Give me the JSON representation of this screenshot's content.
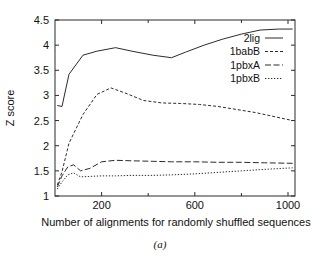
{
  "chart_data": {
    "type": "line",
    "title": "",
    "xlabel": "Number of alignments for randomly shuffled sequences",
    "ylabel": "Z score",
    "caption": "(a)",
    "xlim": [
      0,
      1030
    ],
    "ylim": [
      1,
      4.5
    ],
    "xticks": [
      200,
      600,
      1000
    ],
    "xticks_minor": [
      400,
      800
    ],
    "xtick_labels": [
      "200",
      "600",
      "1000"
    ],
    "yticks": [
      1,
      1.5,
      2,
      2.5,
      3,
      3.5,
      4,
      4.5
    ],
    "ytick_labels": [
      "1",
      "1.5",
      "2",
      "2.5",
      "3",
      "3.5",
      "4",
      "4.5"
    ],
    "grid": false,
    "legend_position": "upper-right",
    "series": [
      {
        "name": "2lig",
        "style": "solid",
        "x": [
          10,
          30,
          60,
          120,
          180,
          260,
          330,
          420,
          500,
          560,
          640,
          720,
          800,
          880,
          960,
          1020
        ],
        "y": [
          2.8,
          2.78,
          3.42,
          3.8,
          3.88,
          3.95,
          3.88,
          3.8,
          3.75,
          3.86,
          4.0,
          4.12,
          4.22,
          4.3,
          4.32,
          4.32
        ]
      },
      {
        "name": "1babB",
        "style": "dashed",
        "x": [
          10,
          30,
          60,
          120,
          180,
          240,
          300,
          380,
          460,
          540,
          620,
          700,
          780,
          860,
          940,
          1020
        ],
        "y": [
          1.22,
          1.48,
          2.05,
          2.62,
          3.02,
          3.15,
          3.05,
          2.9,
          2.85,
          2.84,
          2.82,
          2.78,
          2.72,
          2.66,
          2.58,
          2.5
        ]
      },
      {
        "name": "1pbxA",
        "style": "dashdot",
        "x": [
          10,
          30,
          55,
          80,
          110,
          150,
          200,
          260,
          330,
          420,
          500,
          600,
          700,
          800,
          900,
          1020
        ],
        "y": [
          1.18,
          1.4,
          1.58,
          1.62,
          1.5,
          1.55,
          1.68,
          1.71,
          1.7,
          1.69,
          1.68,
          1.68,
          1.67,
          1.67,
          1.66,
          1.65
        ]
      },
      {
        "name": "1pbxB",
        "style": "dotted",
        "x": [
          10,
          30,
          55,
          80,
          110,
          150,
          200,
          260,
          330,
          420,
          500,
          600,
          700,
          800,
          900,
          1020
        ],
        "y": [
          1.14,
          1.28,
          1.42,
          1.46,
          1.38,
          1.39,
          1.4,
          1.4,
          1.41,
          1.41,
          1.42,
          1.44,
          1.47,
          1.5,
          1.53,
          1.56
        ]
      }
    ]
  },
  "legend": {
    "items": [
      {
        "label": "2lig"
      },
      {
        "label": "1babB"
      },
      {
        "label": "1pbxA"
      },
      {
        "label": "1pbxB"
      }
    ]
  }
}
